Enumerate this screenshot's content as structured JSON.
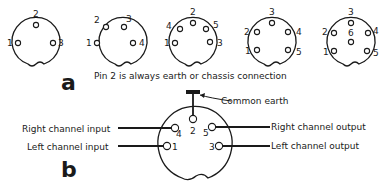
{
  "panel_a": {
    "label": "a",
    "caption": "Pin 2 is always earth or chassis connection",
    "connectors": [
      {
        "name": "3-pin",
        "pins": [
          "1",
          "2",
          "3"
        ]
      },
      {
        "name": "4-pin",
        "pins": [
          "1",
          "2",
          "3",
          "4"
        ]
      },
      {
        "name": "5-pin-240",
        "pins": [
          "1",
          "4",
          "2",
          "5",
          "3"
        ]
      },
      {
        "name": "5-pin-180",
        "pins": [
          "1",
          "2",
          "3",
          "4",
          "5"
        ]
      },
      {
        "name": "6-pin",
        "pins": [
          "1",
          "2",
          "3",
          "4",
          "5",
          "6"
        ]
      }
    ]
  },
  "panel_b": {
    "label": "b",
    "common_earth": "Common earth",
    "right_input": "Right channel input",
    "left_input": "Left channel input",
    "right_output": "Right channel output",
    "left_output": "Left channel output",
    "pins": {
      "p1": "1",
      "p2": "2",
      "p3": "3",
      "p4": "4",
      "p5": "5"
    }
  }
}
